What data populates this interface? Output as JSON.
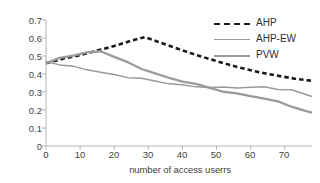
{
  "chart_data": {
    "type": "line",
    "title": "",
    "xlabel": "number of access userrs",
    "ylabel": "available load variance",
    "xlim": [
      0,
      78
    ],
    "ylim": [
      0,
      0.7
    ],
    "grid": false,
    "legend_position": "top-right",
    "xticks": [
      0,
      10,
      20,
      30,
      40,
      50,
      60,
      70
    ],
    "yticks": [
      "0",
      "0.1",
      "0.2",
      "0.3",
      "0.4",
      "0.5",
      "0.6",
      "0.7"
    ],
    "series": [
      {
        "name": "AHP",
        "style": "dashed",
        "color": "#1a1a1a",
        "x": [
          0,
          5,
          10,
          15,
          20,
          25,
          29,
          33,
          38,
          43,
          48,
          53,
          58,
          63,
          68,
          73,
          78
        ],
        "values": [
          0.46,
          0.485,
          0.505,
          0.53,
          0.555,
          0.585,
          0.605,
          0.578,
          0.545,
          0.512,
          0.483,
          0.455,
          0.43,
          0.408,
          0.39,
          0.374,
          0.362
        ]
      },
      {
        "name": "AHP-EW",
        "style": "solid",
        "color": "#9a9a9a",
        "x": [
          0,
          4,
          8,
          12,
          16,
          20,
          24,
          28,
          32,
          36,
          40,
          44,
          48,
          52,
          56,
          60,
          64,
          68,
          72,
          76,
          78
        ],
        "values": [
          0.47,
          0.452,
          0.438,
          0.424,
          0.41,
          0.398,
          0.384,
          0.372,
          0.358,
          0.348,
          0.34,
          0.332,
          0.324,
          0.322,
          0.324,
          0.327,
          0.33,
          0.317,
          0.307,
          0.286,
          0.275
        ]
      },
      {
        "name": "PVW",
        "style": "solid",
        "color": "#9a9a9a",
        "x": [
          0,
          4,
          8,
          12,
          16,
          20,
          24,
          28,
          32,
          36,
          40,
          44,
          48,
          52,
          56,
          60,
          64,
          68,
          72,
          76,
          78
        ],
        "values": [
          0.46,
          0.487,
          0.505,
          0.52,
          0.53,
          0.495,
          0.46,
          0.43,
          0.404,
          0.38,
          0.36,
          0.34,
          0.322,
          0.305,
          0.292,
          0.28,
          0.262,
          0.243,
          0.222,
          0.196,
          0.185
        ]
      }
    ]
  },
  "legend": {
    "items": [
      {
        "label": "AHP"
      },
      {
        "label": "AHP-EW"
      },
      {
        "label": "PVW"
      }
    ]
  }
}
